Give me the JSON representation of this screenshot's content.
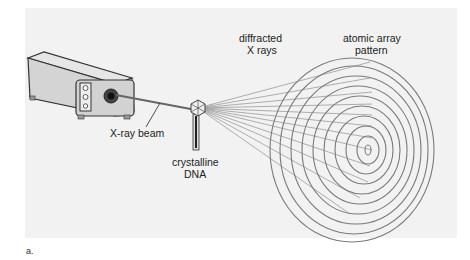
{
  "figure": {
    "labels": {
      "xray_beam": "X-ray beam",
      "crystalline_dna_line1": "crystalline",
      "crystalline_dna_line2": "DNA",
      "diffracted_line1": "diffracted",
      "diffracted_line2": "X rays",
      "pattern_line1": "atomic array",
      "pattern_line2": "pattern"
    },
    "panel_letter": "a.",
    "colors": {
      "panel_bg": "#f2f2f2",
      "machine_body": "#d9d9d9",
      "line": "#555555",
      "ring": "#7a7a7a"
    }
  }
}
